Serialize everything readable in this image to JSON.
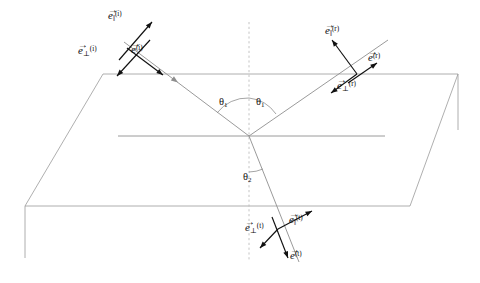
{
  "figure": {
    "colors": {
      "ray": "#8e8e8e",
      "plane_edge": "#9a9a9a",
      "normal": "#bdbdbd",
      "unit_vector": "#111111",
      "background": "#ffffff"
    }
  },
  "labels": {
    "incident": {
      "parallel": {
        "symbol": "e",
        "sub": "‖",
        "sup": "(i)",
        "arrow": "→"
      },
      "perpendicular": {
        "symbol": "e",
        "sub": "⊥",
        "sup": "(i)",
        "arrow": "→"
      },
      "propagation": {
        "symbol": "e",
        "sub": "",
        "sup": "(i)",
        "arrow": "→"
      }
    },
    "reflected": {
      "parallel": {
        "symbol": "e",
        "sub": "‖",
        "sup": "(r)",
        "arrow": "→"
      },
      "perpendicular": {
        "symbol": "e",
        "sub": "⊥",
        "sup": "(r)",
        "arrow": "→"
      },
      "propagation": {
        "symbol": "e",
        "sub": "",
        "sup": "(r)",
        "arrow": "→"
      }
    },
    "transmitted": {
      "parallel": {
        "symbol": "e",
        "sub": "‖",
        "sup": "(t)",
        "arrow": "→"
      },
      "perpendicular": {
        "symbol": "e",
        "sub": "⊥",
        "sup": "(t)",
        "arrow": "→"
      },
      "propagation": {
        "symbol": "e",
        "sub": "",
        "sup": "(t)",
        "arrow": "→"
      }
    },
    "angles": {
      "incidence": {
        "symbol": "θ",
        "sub": "1"
      },
      "reflection": {
        "symbol": "θ",
        "sub": "1"
      },
      "refraction": {
        "symbol": "θ",
        "sub": "2"
      }
    }
  },
  "geometry": {
    "origin": {
      "x": 249,
      "y": 136
    },
    "plane_quad": "103,74 458,74 410,206 25,206",
    "interface_line": {
      "x1": 118,
      "y1": 136,
      "x2": 385,
      "y2": 136
    },
    "normal": {
      "x": 249,
      "y_top": 22,
      "y_bottom": 260
    },
    "left_drop": {
      "x": 25,
      "y1": 206,
      "y2": 258
    },
    "right_drop": {
      "x": 458,
      "y1": 74,
      "y2": 130
    },
    "rays": {
      "incident": {
        "x1": 124,
        "y1": 42,
        "x2": 249,
        "y2": 136
      },
      "reflected": {
        "x1": 249,
        "y1": 136,
        "x2": 388,
        "y2": 40
      },
      "transmitted": {
        "x1": 249,
        "y1": 136,
        "x2": 299,
        "y2": 262
      }
    }
  }
}
